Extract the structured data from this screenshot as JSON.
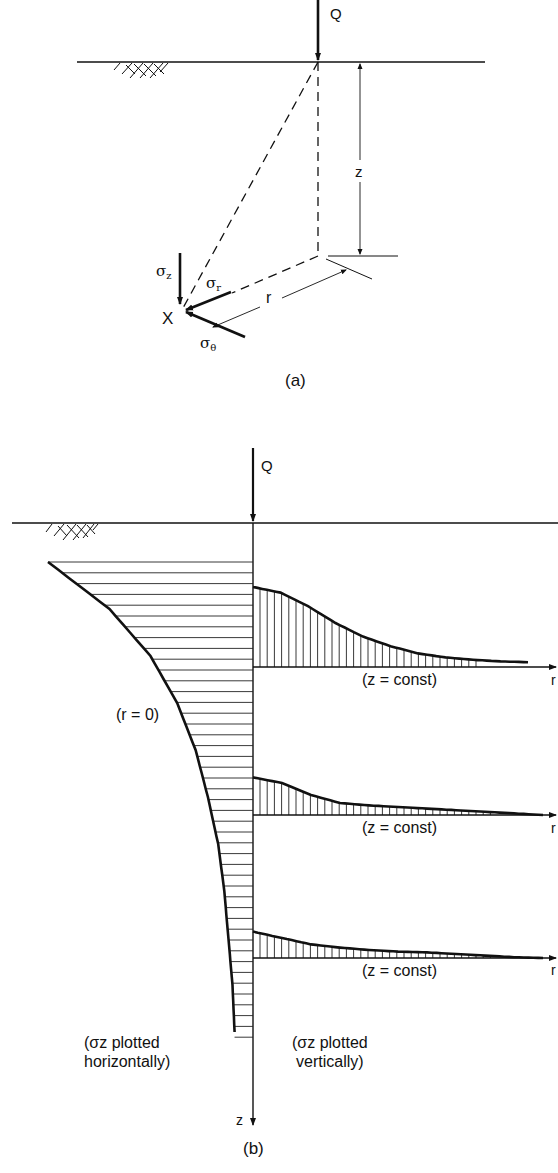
{
  "figure_a": {
    "caption": "(a)",
    "load_label": "Q",
    "depth_label": "z",
    "radius_label": "r",
    "point_label": "X",
    "stress_labels": {
      "sigma_z": "σ",
      "sigma_z_sub": "z",
      "sigma_r": "σ",
      "sigma_r_sub": "r",
      "sigma_theta": "σ",
      "sigma_theta_sub": "θ"
    }
  },
  "figure_b": {
    "caption": "(b)",
    "load_label": "Q",
    "axis_label_depth": "z",
    "axis_label_radius": "r",
    "left_curve_label": "(r = 0)",
    "right_curve_labels": [
      "(z = const)",
      "(z = const)",
      "(z = const)"
    ],
    "left_note_line1": "(σz plotted",
    "left_note_line2": "horizontally)",
    "right_note_line1": "(σz plotted",
    "right_note_line2": "vertically)"
  },
  "chart_data": {
    "type": "line",
    "series": [
      {
        "name": "σz vs depth (r = 0), plotted horizontally",
        "x_depth_norm": [
          0.0,
          0.1,
          0.2,
          0.3,
          0.4,
          0.5,
          0.6,
          0.7,
          0.8,
          0.9,
          1.0
        ],
        "sigma_norm": [
          1.0,
          0.7,
          0.5,
          0.37,
          0.28,
          0.22,
          0.17,
          0.14,
          0.12,
          0.1,
          0.09
        ]
      },
      {
        "name": "σz vs r at z = const (shallow)",
        "r_norm": [
          0,
          0.1,
          0.2,
          0.3,
          0.4,
          0.5,
          0.6,
          0.7,
          0.8,
          0.9,
          1.0
        ],
        "sigma_norm": [
          1.0,
          0.93,
          0.76,
          0.55,
          0.38,
          0.26,
          0.17,
          0.12,
          0.09,
          0.07,
          0.06
        ]
      },
      {
        "name": "σz vs r at z = const (middle)",
        "r_norm": [
          0,
          0.1,
          0.2,
          0.3,
          0.4,
          0.5,
          0.6,
          0.7,
          0.8,
          0.9,
          1.0
        ],
        "sigma_norm": [
          0.47,
          0.4,
          0.25,
          0.15,
          0.12,
          0.1,
          0.08,
          0.06,
          0.04,
          0.02,
          0.0
        ]
      },
      {
        "name": "σz vs r at z = const (deep)",
        "r_norm": [
          0,
          0.1,
          0.2,
          0.3,
          0.4,
          0.5,
          0.6,
          0.7,
          0.8,
          0.9,
          1.0
        ],
        "sigma_norm": [
          0.33,
          0.25,
          0.17,
          0.13,
          0.1,
          0.08,
          0.07,
          0.05,
          0.03,
          0.01,
          0.0
        ]
      }
    ],
    "xlabel": "r",
    "ylabel": "z",
    "grid": false
  }
}
